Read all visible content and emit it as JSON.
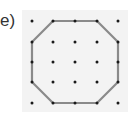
{
  "label": "e)",
  "colors": {
    "background": "#ffffff",
    "panel": "#f3f3f3",
    "dot": "#1a1a1a",
    "shape_stroke": "#8a8a8a",
    "label": "#333333"
  },
  "grid": {
    "columns": 5,
    "rows": 5,
    "x": [
      32,
      53,
      75,
      97,
      118
    ],
    "y": [
      21,
      42,
      62,
      82,
      103
    ]
  },
  "shape": {
    "type": "octagon",
    "vertices_grid": [
      [
        1,
        0
      ],
      [
        3,
        0
      ],
      [
        4,
        1
      ],
      [
        4,
        3
      ],
      [
        3,
        4
      ],
      [
        1,
        4
      ],
      [
        0,
        3
      ],
      [
        0,
        1
      ]
    ]
  }
}
